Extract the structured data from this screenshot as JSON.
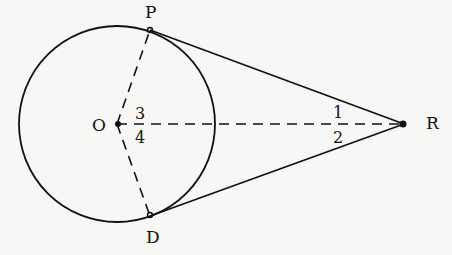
{
  "diagram": {
    "points": {
      "O": {
        "label": "O"
      },
      "P": {
        "label": "P"
      },
      "D": {
        "label": "D"
      },
      "R": {
        "label": "R"
      }
    },
    "angles": {
      "angle3": {
        "label": "3"
      },
      "angle4": {
        "label": "4"
      },
      "angle1": {
        "label": "1"
      },
      "angle2": {
        "label": "2"
      }
    },
    "colors": {
      "stroke": "#111111",
      "background": "#f7f7f5"
    }
  }
}
